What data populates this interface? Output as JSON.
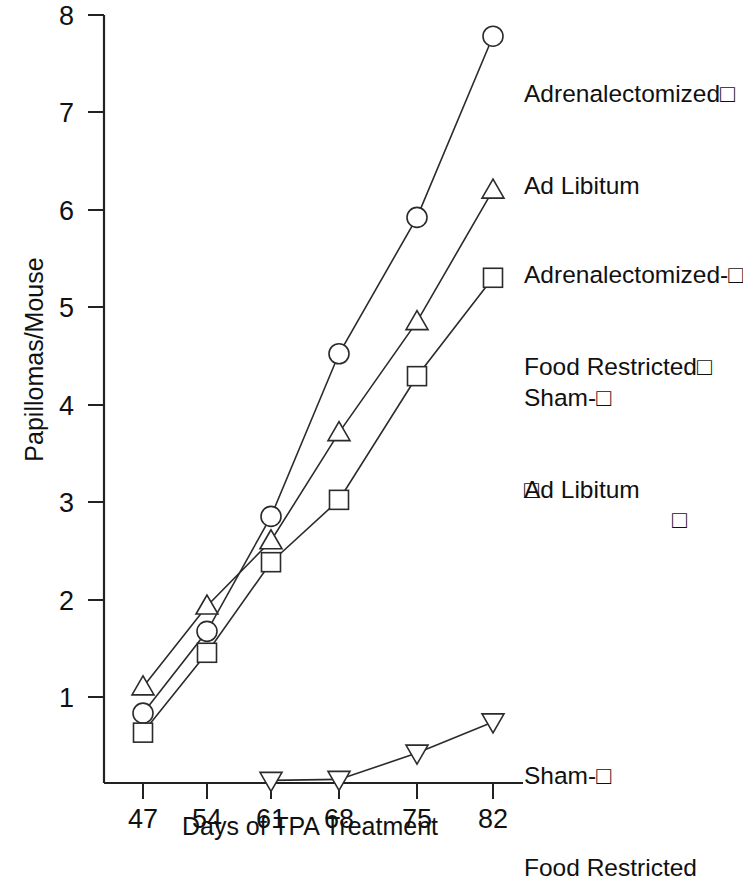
{
  "chart_data": {
    "type": "line",
    "title": "",
    "xlabel": "Days of TPA Treatment",
    "ylabel": "Papillomas/Mouse",
    "x": [
      47,
      54,
      61,
      68,
      75,
      82
    ],
    "xticklabels": [
      "47",
      "54",
      "61",
      "68",
      "75",
      "82"
    ],
    "yticklabels": [
      "1",
      "2",
      "3",
      "4",
      "5",
      "6",
      "7",
      "8"
    ],
    "ytickvalues": [
      1,
      2,
      3,
      4,
      5,
      6,
      7,
      8
    ],
    "xlim": [
      43.5,
      85.5
    ],
    "ylim": [
      0,
      8
    ],
    "grid": false,
    "legend_position": "right-inline",
    "series": [
      {
        "name": "Adrenalectomized-Ad Libitum",
        "marker": "circle",
        "x": [
          47,
          54,
          61,
          68,
          75,
          82
        ],
        "values": [
          0.83,
          1.67,
          2.85,
          4.52,
          5.92,
          7.78
        ]
      },
      {
        "name": "Adrenalectomized-Food Restricted",
        "marker": "triangle-up",
        "x": [
          47,
          54,
          61,
          68,
          75,
          82
        ],
        "values": [
          1.1,
          1.93,
          2.6,
          3.71,
          4.85,
          6.2
        ]
      },
      {
        "name": "Sham-Ad Libitum",
        "marker": "square",
        "x": [
          47,
          54,
          61,
          68,
          75,
          82
        ],
        "values": [
          0.63,
          1.45,
          2.38,
          3.02,
          4.29,
          5.3
        ]
      },
      {
        "name": "Sham-Food Restricted",
        "marker": "triangle-down",
        "x": [
          61,
          68,
          75,
          82
        ],
        "values": [
          0.14,
          0.15,
          0.42,
          0.74
        ]
      }
    ]
  },
  "axes": {
    "ylabel": "Papillomas/Mouse",
    "xlabel": "Days of TPA Treatment",
    "yticks": [
      "8",
      "7",
      "6",
      "5",
      "4",
      "3",
      "2",
      "1"
    ],
    "xticks": [
      "47",
      "54",
      "61",
      "68",
      "75",
      "82"
    ]
  },
  "legend": {
    "adrenalectomized_ad_libitum": {
      "line1": "Adrenalectomized□",
      "line2": "Ad Libitum"
    },
    "adrenalectomized_food_restricted": {
      "line1": "Adrenalectomized-□",
      "line2": "Food Restricted□",
      "line3": "□",
      "line3_right": "□"
    },
    "sham_ad_libitum": {
      "line1": "Sham-□",
      "line2": "Ad Libitum"
    },
    "sham_food_restricted": {
      "line1": "Sham-□",
      "line2": "Food Restricted"
    }
  }
}
